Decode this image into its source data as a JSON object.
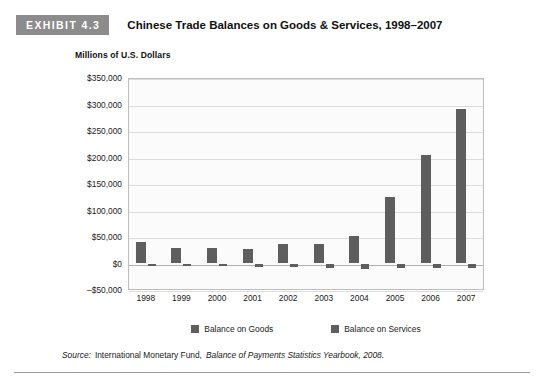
{
  "header": {
    "exhibit_label": "EXHIBIT 4.3",
    "title": "Chinese Trade Balances on Goods & Services, 1998–2007"
  },
  "source": {
    "prefix": "Source:",
    "publisher": "International Monetary Fund,",
    "publication": "Balance of Payments Statistics Yearbook, 2008."
  },
  "chart_data": {
    "type": "bar",
    "title": "Chinese Trade Balances on Goods & Services, 1998–2007",
    "ylabel": "Millions of U.S. Dollars",
    "xlabel": "",
    "categories": [
      "1998",
      "1999",
      "2000",
      "2001",
      "2002",
      "2003",
      "2004",
      "2005",
      "2006",
      "2007"
    ],
    "series": [
      {
        "name": "Balance on Goods",
        "values": [
          40800,
          28900,
          28700,
          28100,
          37400,
          36100,
          51200,
          124600,
          204900,
          291500
        ]
      },
      {
        "name": "Balance on Services",
        "values": [
          -2600,
          -5300,
          -5600,
          -5900,
          -6800,
          -8600,
          -9700,
          -9400,
          -8800,
          -7900
        ]
      }
    ],
    "ylim": [
      -50000,
      350000
    ],
    "ytick_step": 50000,
    "ytick_labels": [
      "$350,000",
      "$300,000",
      "$250,000",
      "$200,000",
      "$150,000",
      "$100,000",
      "$50,000",
      "$0",
      "–$50,000"
    ],
    "ytick_values": [
      350000,
      300000,
      250000,
      200000,
      150000,
      100000,
      50000,
      0,
      -50000
    ],
    "grid": true,
    "legend": [
      "Balance on Goods",
      "Balance on Services"
    ],
    "legend_position": "bottom",
    "bar_color": "#5e5e5e",
    "plot_bg": "#fbfbfb",
    "grid_color": "#dcdcdc"
  }
}
